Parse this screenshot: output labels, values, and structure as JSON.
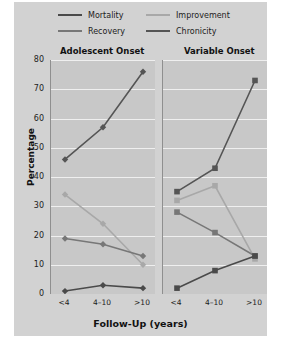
{
  "chart_data": {
    "type": "line",
    "title": "",
    "xlabel": "Follow-Up (years)",
    "ylabel": "Percentage",
    "ylim": [
      0,
      80
    ],
    "yticks": [
      0,
      10,
      20,
      30,
      40,
      50,
      60,
      70,
      80
    ],
    "grid": true,
    "legend_position": "top",
    "categories": [
      "<4",
      "4–10",
      ">10"
    ],
    "panels": [
      {
        "title": "Adolescent Onset",
        "marker": "diamond",
        "series": [
          {
            "name": "Recovery",
            "values": [
              46,
              57,
              76
            ],
            "color": "#555555"
          },
          {
            "name": "Improvement",
            "values": [
              34,
              24,
              10
            ],
            "color": "#a8a8a8"
          },
          {
            "name": "Chronicity",
            "values": [
              19,
              17,
              13
            ],
            "color": "#777777"
          },
          {
            "name": "Mortality",
            "values": [
              1,
              3,
              2
            ],
            "color": "#4a4a4a"
          }
        ]
      },
      {
        "title": "Variable Onset",
        "marker": "square",
        "series": [
          {
            "name": "Recovery",
            "values": [
              35,
              43,
              73
            ],
            "color": "#555555"
          },
          {
            "name": "Improvement",
            "values": [
              32,
              37,
              12
            ],
            "color": "#a8a8a8"
          },
          {
            "name": "Chronicity",
            "values": [
              28,
              21,
              13
            ],
            "color": "#777777"
          },
          {
            "name": "Mortality",
            "values": [
              2,
              8,
              13
            ],
            "color": "#4a4a4a"
          }
        ]
      }
    ]
  },
  "legend": {
    "items": [
      {
        "label": "Mortality",
        "color": "#4a4a4a"
      },
      {
        "label": "Improvement",
        "color": "#a8a8a8"
      },
      {
        "label": "Recovery",
        "color": "#777777"
      },
      {
        "label": "Chronicity",
        "color": "#555555"
      }
    ]
  },
  "axes": {
    "ylabel": "Percentage",
    "xlabel": "Follow-Up (years)",
    "yticks": [
      "80",
      "70",
      "60",
      "50",
      "40",
      "30",
      "20",
      "10",
      "0"
    ],
    "xticks": [
      "<4",
      "4–10",
      ">10",
      "<4",
      "4–10",
      ">10"
    ]
  },
  "panel_titles": {
    "left": "Adolescent Onset",
    "right": "Variable Onset"
  },
  "colors": {
    "figure_background": "#d2d2d2",
    "panel_background": "#c8c8c8",
    "gridline": "#efefef",
    "text": "#1c1c1c"
  }
}
